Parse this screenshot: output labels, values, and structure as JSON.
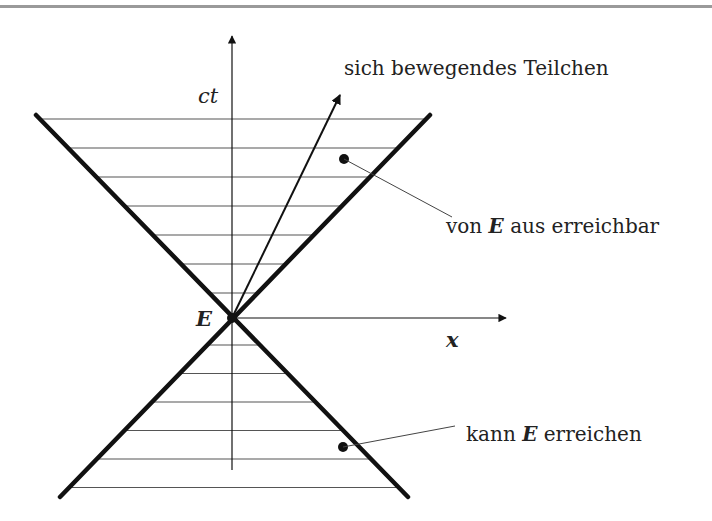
{
  "diagram": {
    "axes": {
      "vertical_label": "ct",
      "horizontal_label": "x"
    },
    "event_label": "E",
    "particle_label": "sich bewegendes Teilchen",
    "future_cone": {
      "label_prefix": "von ",
      "label_event": "E",
      "label_suffix": " aus erreichbar"
    },
    "past_cone": {
      "label_prefix": "kann ",
      "label_event": "E",
      "label_suffix": " erreichen"
    },
    "hatch_lines_future": 7,
    "hatch_lines_past": 6,
    "colors": {
      "line": "#111111",
      "hatch": "#555555",
      "frame": "#9a9a9a"
    }
  }
}
